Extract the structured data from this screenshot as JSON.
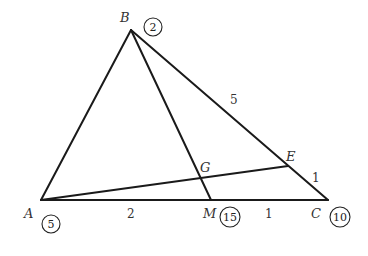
{
  "diagram": {
    "title": "",
    "points": [
      {
        "id": "A",
        "label": "A",
        "mass": "5"
      },
      {
        "id": "B",
        "label": "B",
        "mass": "2"
      },
      {
        "id": "C",
        "label": "C",
        "mass": "10"
      },
      {
        "id": "M",
        "label": "M",
        "mass": "15"
      },
      {
        "id": "E",
        "label": "E",
        "mass": ""
      },
      {
        "id": "G",
        "label": "G",
        "mass": ""
      }
    ],
    "segments": [
      {
        "from": "A",
        "to": "B"
      },
      {
        "from": "B",
        "to": "C"
      },
      {
        "from": "A",
        "to": "C"
      },
      {
        "from": "B",
        "to": "M"
      },
      {
        "from": "A",
        "to": "E"
      }
    ],
    "length_labels": {
      "AM": "2",
      "MC": "1",
      "BE": "5",
      "EC": "1"
    }
  }
}
